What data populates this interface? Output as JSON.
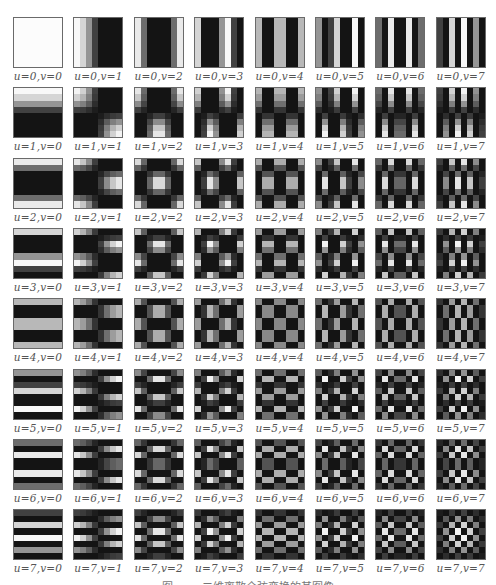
{
  "figure": {
    "grid_size": 8,
    "pixel_value_rule": "max(0, cos((2x+1)u*pi/16) * cos((2y+1)v*pi/16)) mapped to grayscale",
    "cells": [
      {
        "u": 0,
        "v": 0,
        "label": "u=0,v=0"
      },
      {
        "u": 0,
        "v": 1,
        "label": "u=0,v=1"
      },
      {
        "u": 0,
        "v": 2,
        "label": "u=0,v=2"
      },
      {
        "u": 0,
        "v": 3,
        "label": "u=0,v=3"
      },
      {
        "u": 0,
        "v": 4,
        "label": "u=0,v=4"
      },
      {
        "u": 0,
        "v": 5,
        "label": "u=0,v=5"
      },
      {
        "u": 0,
        "v": 6,
        "label": "u=0,v=6"
      },
      {
        "u": 0,
        "v": 7,
        "label": "u=0,v=7"
      },
      {
        "u": 1,
        "v": 0,
        "label": "u=1,v=0"
      },
      {
        "u": 1,
        "v": 1,
        "label": "u=1,v=1"
      },
      {
        "u": 1,
        "v": 2,
        "label": "u=1,v=2"
      },
      {
        "u": 1,
        "v": 3,
        "label": "u=1,v=3"
      },
      {
        "u": 1,
        "v": 4,
        "label": "u=1,v=4"
      },
      {
        "u": 1,
        "v": 5,
        "label": "u=1,v=5"
      },
      {
        "u": 1,
        "v": 6,
        "label": "u=1,v=6"
      },
      {
        "u": 1,
        "v": 7,
        "label": "u=1,v=7"
      },
      {
        "u": 2,
        "v": 0,
        "label": "u=2,v=0"
      },
      {
        "u": 2,
        "v": 1,
        "label": "u=2,v=1"
      },
      {
        "u": 2,
        "v": 2,
        "label": "u=2,v=2"
      },
      {
        "u": 2,
        "v": 3,
        "label": "u=2,v=3"
      },
      {
        "u": 2,
        "v": 4,
        "label": "u=2,v=4"
      },
      {
        "u": 2,
        "v": 5,
        "label": "u=2,v=5"
      },
      {
        "u": 2,
        "v": 6,
        "label": "u=2,v=6"
      },
      {
        "u": 2,
        "v": 7,
        "label": "u=2,v=7"
      },
      {
        "u": 3,
        "v": 0,
        "label": "u=3,v=0"
      },
      {
        "u": 3,
        "v": 1,
        "label": "u=3,v=1"
      },
      {
        "u": 3,
        "v": 2,
        "label": "u=3,v=2"
      },
      {
        "u": 3,
        "v": 3,
        "label": "u=3,v=3"
      },
      {
        "u": 3,
        "v": 4,
        "label": "u=3,v=4"
      },
      {
        "u": 3,
        "v": 5,
        "label": "u=3,v=5"
      },
      {
        "u": 3,
        "v": 6,
        "label": "u=3,v=6"
      },
      {
        "u": 3,
        "v": 7,
        "label": "u=3,v=7"
      },
      {
        "u": 4,
        "v": 0,
        "label": "u=4,v=0"
      },
      {
        "u": 4,
        "v": 1,
        "label": "u=4,v=1"
      },
      {
        "u": 4,
        "v": 2,
        "label": "u=4,v=2"
      },
      {
        "u": 4,
        "v": 3,
        "label": "u=4,v=3"
      },
      {
        "u": 4,
        "v": 4,
        "label": "u=4,v=4"
      },
      {
        "u": 4,
        "v": 5,
        "label": "u=4,v=5"
      },
      {
        "u": 4,
        "v": 6,
        "label": "u=4,v=6"
      },
      {
        "u": 4,
        "v": 7,
        "label": "u=4,v=7"
      },
      {
        "u": 5,
        "v": 0,
        "label": "u=5,v=0"
      },
      {
        "u": 5,
        "v": 1,
        "label": "u=5,v=1"
      },
      {
        "u": 5,
        "v": 2,
        "label": "u=5,v=2"
      },
      {
        "u": 5,
        "v": 3,
        "label": "u=5,v=3"
      },
      {
        "u": 5,
        "v": 4,
        "label": "u=5,v=4"
      },
      {
        "u": 5,
        "v": 5,
        "label": "u=5,v=5"
      },
      {
        "u": 5,
        "v": 6,
        "label": "u=5,v=6"
      },
      {
        "u": 5,
        "v": 7,
        "label": "u=5,v=7"
      },
      {
        "u": 6,
        "v": 0,
        "label": "u=6,v=0"
      },
      {
        "u": 6,
        "v": 1,
        "label": "u=6,v=1"
      },
      {
        "u": 6,
        "v": 2,
        "label": "u=6,v=2"
      },
      {
        "u": 6,
        "v": 3,
        "label": "u=6,v=3"
      },
      {
        "u": 6,
        "v": 4,
        "label": "u=6,v=4"
      },
      {
        "u": 6,
        "v": 5,
        "label": "u=6,v=5"
      },
      {
        "u": 6,
        "v": 6,
        "label": "u=6,v=6"
      },
      {
        "u": 6,
        "v": 7,
        "label": "u=6,v=7"
      },
      {
        "u": 7,
        "v": 0,
        "label": "u=7,v=0"
      },
      {
        "u": 7,
        "v": 1,
        "label": "u=7,v=1"
      },
      {
        "u": 7,
        "v": 2,
        "label": "u=7,v=2"
      },
      {
        "u": 7,
        "v": 3,
        "label": "u=7,v=3"
      },
      {
        "u": 7,
        "v": 4,
        "label": "u=7,v=4"
      },
      {
        "u": 7,
        "v": 5,
        "label": "u=7,v=5"
      },
      {
        "u": 7,
        "v": 6,
        "label": "u=7,v=6"
      },
      {
        "u": 7,
        "v": 7,
        "label": "u=7,v=7"
      }
    ],
    "caption": "图 ……  二维离散余弦变换的基图像"
  },
  "colors": {
    "background": "#ffffff",
    "cell_border": "#6a6a6a",
    "label_text": "#555555"
  }
}
